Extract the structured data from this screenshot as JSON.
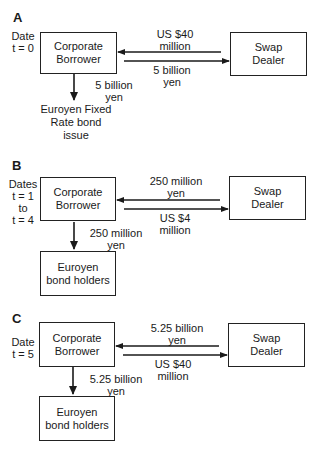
{
  "panels": [
    {
      "id": "A",
      "label": "A",
      "date_lines": [
        "Date",
        "t = 0"
      ],
      "borrower": [
        "Corporate",
        "Borrower"
      ],
      "dealer": [
        "Swap",
        "Dealer"
      ],
      "to_borrower": [
        "US $40",
        "million"
      ],
      "to_dealer": [
        "5 billion",
        "yen"
      ],
      "down_flow": [
        "5 billion",
        "yen"
      ],
      "bottom": [
        "Euroyen Fixed",
        "Rate bond",
        "issue"
      ],
      "bottom_is_box": false
    },
    {
      "id": "B",
      "label": "B",
      "date_lines": [
        "Dates",
        "t = 1",
        "to",
        "t = 4"
      ],
      "borrower": [
        "Corporate",
        "Borrower"
      ],
      "dealer": [
        "Swap",
        "Dealer"
      ],
      "to_borrower": [
        "250 million",
        "yen"
      ],
      "to_dealer": [
        "US $4",
        "million"
      ],
      "down_flow": [
        "250 million",
        "yen"
      ],
      "bottom": [
        "Euroyen",
        "bond holders"
      ],
      "bottom_is_box": true
    },
    {
      "id": "C",
      "label": "C",
      "date_lines": [
        "Date",
        "t = 5"
      ],
      "borrower": [
        "Corporate",
        "Borrower"
      ],
      "dealer": [
        "Swap",
        "Dealer"
      ],
      "to_borrower": [
        "5.25 billion",
        "yen"
      ],
      "to_dealer": [
        "US $40",
        "million"
      ],
      "down_flow": [
        "5.25 billion",
        "yen"
      ],
      "bottom": [
        "Euroyen",
        "bond holders"
      ],
      "bottom_is_box": true
    }
  ],
  "colors": {
    "line": "#1a1a1a",
    "box_border": "#222222",
    "background": "#ffffff"
  }
}
